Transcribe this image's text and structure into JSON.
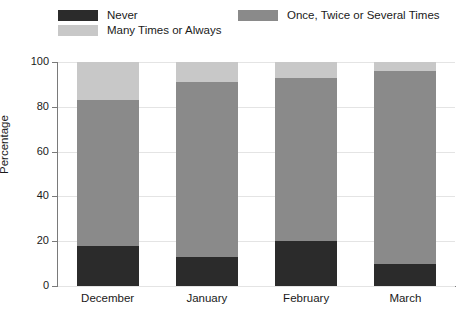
{
  "chart_data": {
    "type": "bar",
    "stacked": true,
    "title": "",
    "xlabel": "",
    "ylabel": "Percentage",
    "categories": [
      "December",
      "January",
      "February",
      "March"
    ],
    "series": [
      {
        "name": "Never",
        "color": "#2b2b2b",
        "values": [
          18,
          13,
          20,
          10
        ]
      },
      {
        "name": "Once, Twice or Several Times",
        "color": "#8a8a8a",
        "values": [
          65,
          78,
          73,
          86
        ]
      },
      {
        "name": "Many Times or Always",
        "color": "#c8c8c8",
        "values": [
          17,
          9,
          7,
          4
        ]
      }
    ],
    "ylim": [
      0,
      100
    ],
    "yticks": [
      0,
      20,
      40,
      60,
      80,
      100
    ],
    "ytick_labels": [
      "0",
      "20",
      "40",
      "60",
      "80",
      "100"
    ],
    "grid": true,
    "grid_axis": "y",
    "legend_position": "top"
  },
  "legend": {
    "items": [
      {
        "label": "Never",
        "color": "#2b2b2b"
      },
      {
        "label": "Once, Twice or Several Times",
        "color": "#8a8a8a"
      },
      {
        "label": "Many Times or Always",
        "color": "#c8c8c8"
      }
    ]
  },
  "axes": {
    "y_title": "Percentage",
    "y_tick_labels": [
      "100",
      "80",
      "60",
      "40",
      "20",
      "0"
    ],
    "x_tick_labels": [
      "December",
      "January",
      "February",
      "March"
    ]
  },
  "colors": {
    "never": "#2b2b2b",
    "once_twice_several": "#8a8a8a",
    "many_or_always": "#c8c8c8",
    "grid": "#e4e4e4",
    "axis": "#7a7a7a",
    "background": "#ffffff",
    "text": "#1a1a1a"
  }
}
